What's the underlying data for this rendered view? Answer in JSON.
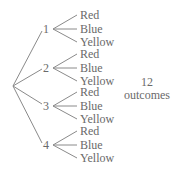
{
  "tree": {
    "branches": [
      {
        "label": "1",
        "y": 29,
        "leaves": [
          "Red",
          "Blue",
          "Yellow"
        ]
      },
      {
        "label": "2",
        "y": 68,
        "leaves": [
          "Red",
          "Blue",
          "Yellow"
        ]
      },
      {
        "label": "3",
        "y": 106,
        "leaves": [
          "Red",
          "Blue",
          "Yellow"
        ]
      },
      {
        "label": "4",
        "y": 145,
        "leaves": [
          "Red",
          "Blue",
          "Yellow"
        ]
      }
    ]
  },
  "summary": {
    "count": "12",
    "label": "outcomes"
  },
  "colors": {
    "line": "#8a8a8a",
    "text": "#6a6a6a"
  }
}
